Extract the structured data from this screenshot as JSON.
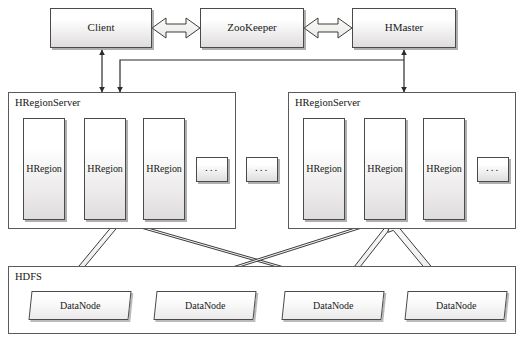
{
  "diagram": {
    "type": "block-diagram"
  },
  "top_tier": {
    "client": {
      "label": "Client"
    },
    "zookeeper": {
      "label": "ZooKeeper"
    },
    "hmaster": {
      "label": "HMaster"
    }
  },
  "region_servers": [
    {
      "label": "HRegionServer",
      "regions": [
        {
          "label": "HRegion"
        },
        {
          "label": "HRegion"
        },
        {
          "label": "HRegion"
        }
      ],
      "more": {
        "label": "..."
      }
    },
    {
      "label": "HRegionServer",
      "regions": [
        {
          "label": "HRegion"
        },
        {
          "label": "HRegion"
        },
        {
          "label": "HRegion"
        }
      ],
      "more": {
        "label": "..."
      }
    }
  ],
  "servers_more": {
    "label": "..."
  },
  "hdfs": {
    "label": "HDFS",
    "datanodes": [
      {
        "label": "DataNode"
      },
      {
        "label": "DataNode"
      },
      {
        "label": "DataNode"
      },
      {
        "label": "DataNode"
      }
    ]
  },
  "connectors": {
    "client_zookeeper": {
      "kind": "bidirectional-block-arrow"
    },
    "zookeeper_hmaster": {
      "kind": "bidirectional-block-arrow"
    },
    "client_to_regionserver": {
      "kind": "bidirectional-line-arrow"
    },
    "hmaster_to_regionserver": {
      "kind": "bidirectional-line-arrow"
    },
    "hmaster_to_regionserver_left": {
      "kind": "directed-line-arrow"
    },
    "region_to_datanode": {
      "kind": "bidirectional-block-arrow",
      "count": 5
    }
  },
  "colors": {
    "stroke": "#4a4a4a",
    "fill_top": "#ffffff",
    "fill_bottom": "#dedcdc",
    "arrow_fill": "#f2f1ef",
    "arrow_stroke": "#3c3c3c",
    "text": "#1a1a1a",
    "background": "#ffffff"
  }
}
